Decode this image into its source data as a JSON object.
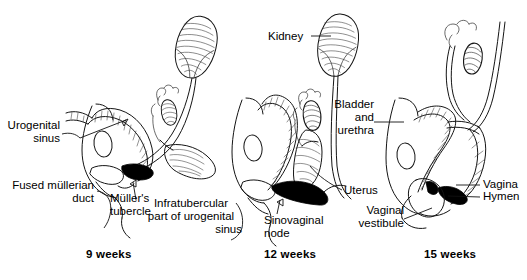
{
  "figure": {
    "background_color": "#ffffff",
    "ink_color": "#141414",
    "stipple_fill": "#d9d9d9",
    "solid_fill": "#000000"
  },
  "panels": [
    {
      "id": "panel-9-weeks",
      "stage_label": "9 weeks",
      "labels": [
        {
          "id": "urogenital-sinus",
          "text": "Urogenital\nsinus",
          "align": "right"
        },
        {
          "id": "fused-mullerian-duct",
          "text": "Fused müllerian\nduct",
          "align": "right"
        },
        {
          "id": "mullers-tubercle",
          "text": "Müller's\ntubercle",
          "align": "left"
        }
      ]
    },
    {
      "id": "panel-12-weeks",
      "stage_label": "12 weeks",
      "labels": [
        {
          "id": "kidney",
          "text": "Kidney",
          "align": "right"
        },
        {
          "id": "infratubercular-part",
          "text": "Infratubercular\npart of urogenital\nsinus",
          "align": "center"
        },
        {
          "id": "sinovaginal-node",
          "text": "Sinovaginal\nnode",
          "align": "left"
        },
        {
          "id": "uterus",
          "text": "Uterus",
          "align": "left"
        }
      ]
    },
    {
      "id": "panel-15-weeks",
      "stage_label": "15 weeks",
      "labels": [
        {
          "id": "bladder-and-urethra",
          "text": "Bladder\nand\nurethra",
          "align": "right"
        },
        {
          "id": "vagina",
          "text": "Vagina",
          "align": "left"
        },
        {
          "id": "hymen",
          "text": "Hymen",
          "align": "left"
        },
        {
          "id": "vaginal-vestibule",
          "text": "Vaginal\nvestibule",
          "align": "right"
        }
      ]
    }
  ],
  "labels_flat": {
    "urogenital_sinus_line1": "Urogenital",
    "urogenital_sinus_line2": "sinus",
    "fused_mullerian_line1": "Fused müllerian",
    "fused_mullerian_line2": "duct",
    "mullers_tubercle_line1": "Müller's",
    "mullers_tubercle_line2": "tubercle",
    "infratubercular_line1": "Infratubercular",
    "infratubercular_line2": "part of urogenital",
    "infratubercular_line3": "sinus",
    "kidney": "Kidney",
    "sinovaginal_line1": "Sinovaginal",
    "sinovaginal_line2": "node",
    "uterus": "Uterus",
    "bladder_line1": "Bladder",
    "bladder_line2": "and",
    "bladder_line3": "urethra",
    "vagina": "Vagina",
    "hymen": "Hymen",
    "vaginal_vestibule_line1": "Vaginal",
    "vaginal_vestibule_line2": "vestibule",
    "stage_9": "9 weeks",
    "stage_12": "12 weeks",
    "stage_15": "15 weeks"
  }
}
